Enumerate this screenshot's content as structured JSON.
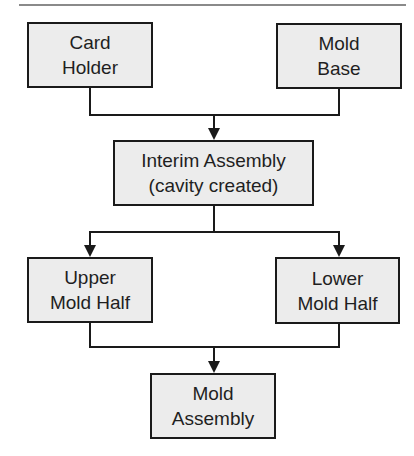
{
  "diagram": {
    "type": "flowchart",
    "colors": {
      "node_fill": "#ececec",
      "node_border": "#1a1a1a",
      "connector": "#1a1a1a",
      "text": "#1f1f1f",
      "top_rule": "#8a8a8a"
    },
    "nodes": {
      "card_holder": {
        "line1": "Card",
        "line2": "Holder"
      },
      "mold_base": {
        "line1": "Mold",
        "line2": "Base"
      },
      "interim_assembly": {
        "line1": "Interim Assembly",
        "line2": "(cavity created)"
      },
      "upper_mold_half": {
        "line1": "Upper",
        "line2": "Mold Half"
      },
      "lower_mold_half": {
        "line1": "Lower",
        "line2": "Mold Half"
      },
      "mold_assembly": {
        "line1": "Mold",
        "line2": "Assembly"
      }
    },
    "edges": [
      {
        "from": [
          "card_holder",
          "mold_base"
        ],
        "to": "interim_assembly",
        "kind": "merge"
      },
      {
        "from": "interim_assembly",
        "to": [
          "upper_mold_half",
          "lower_mold_half"
        ],
        "kind": "split"
      },
      {
        "from": [
          "upper_mold_half",
          "lower_mold_half"
        ],
        "to": "mold_assembly",
        "kind": "merge"
      }
    ]
  }
}
